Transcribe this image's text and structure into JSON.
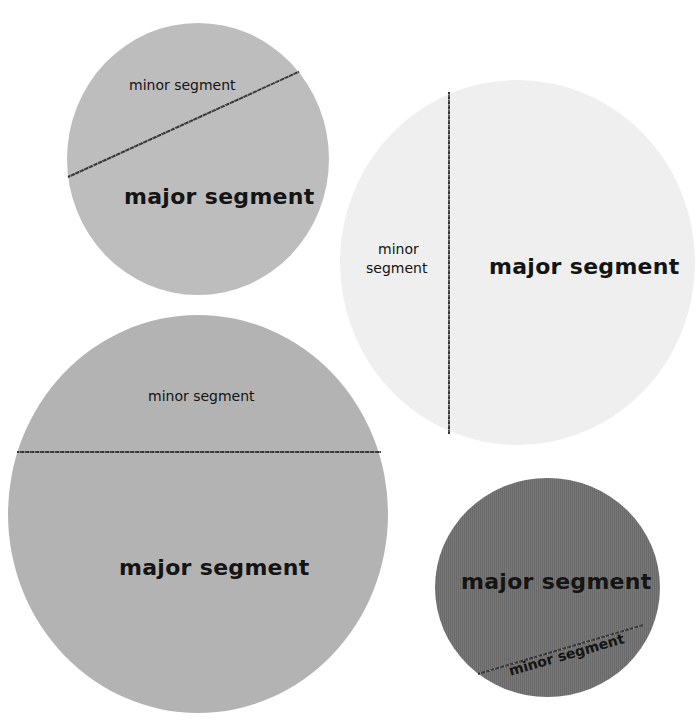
{
  "circles": [
    {
      "id": "top-left",
      "fill": "#bdbdbd",
      "minor_label": "minor segment",
      "major_label": "major segment",
      "chord": "diagonal, rising left-to-right"
    },
    {
      "id": "top-right",
      "fill": "#efefef",
      "minor_label_line1": "minor",
      "minor_label_line2": "segment",
      "major_label": "major segment",
      "chord": "vertical"
    },
    {
      "id": "bottom-left",
      "fill": "#b3b3b3",
      "minor_label": "minor segment",
      "major_label": "major segment",
      "chord": "horizontal"
    },
    {
      "id": "bottom-right",
      "fill": "#727272",
      "minor_label": "minor segment",
      "major_label": "major segment",
      "chord": "diagonal, rising left-to-right, near bottom"
    }
  ]
}
